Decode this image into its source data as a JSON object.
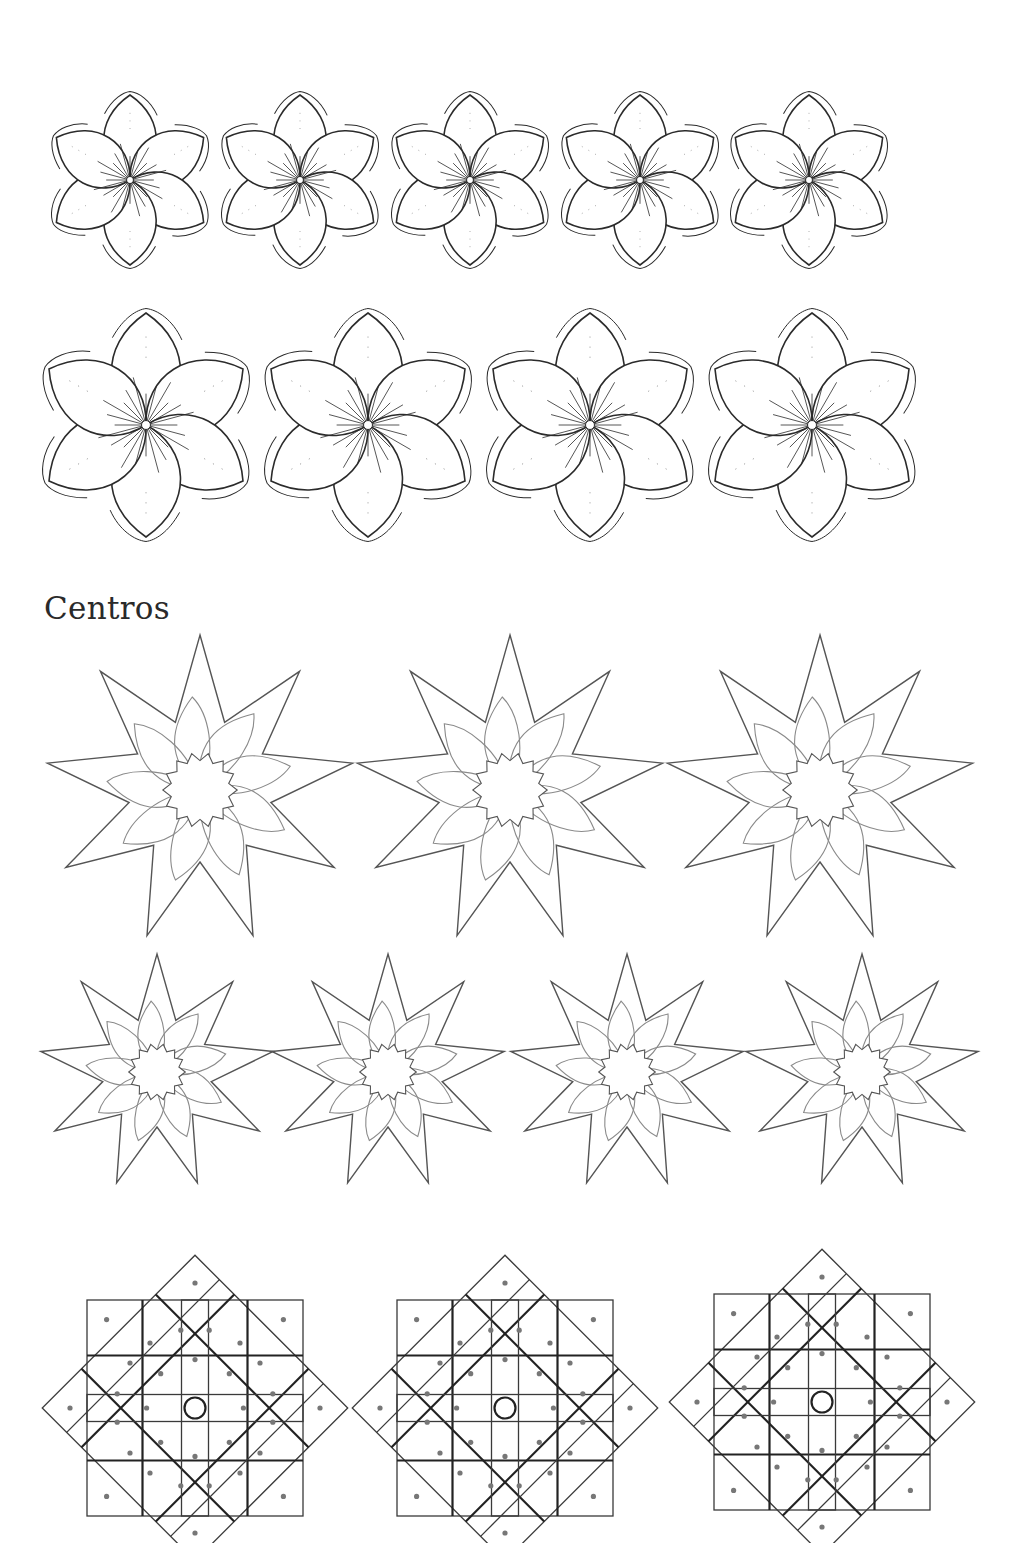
{
  "page": {
    "background": "#ffffff",
    "ink_color": "#2b2b2b",
    "light_ink_color": "#8a8a8a"
  },
  "sections": [
    {
      "id": "flowers-small",
      "type": "six-petal-flower",
      "count": 5,
      "centers": [
        [
          130,
          180
        ],
        [
          300,
          180
        ],
        [
          470,
          180
        ],
        [
          640,
          180
        ],
        [
          809,
          180
        ]
      ],
      "scale": 0.85
    },
    {
      "id": "flowers-large",
      "type": "six-petal-flower",
      "count": 4,
      "centers": [
        [
          146,
          425
        ],
        [
          368,
          425
        ],
        [
          590,
          425
        ],
        [
          812,
          425
        ]
      ],
      "scale": 1.12
    },
    {
      "id": "heading-centros",
      "type": "heading",
      "text": "Centros"
    },
    {
      "id": "stars-large",
      "type": "nine-point-star",
      "count": 3,
      "centers": [
        [
          200,
          790
        ],
        [
          510,
          790
        ],
        [
          820,
          790
        ]
      ],
      "outer_r": 155,
      "inner_r": 72
    },
    {
      "id": "stars-small",
      "type": "nine-point-star",
      "count": 4,
      "centers": [
        [
          157,
          1072
        ],
        [
          388,
          1072
        ],
        [
          627,
          1072
        ],
        [
          862,
          1072
        ]
      ],
      "outer_r": 118,
      "inner_r": 55
    },
    {
      "id": "geometric-medallions",
      "type": "octagram-grid",
      "count": 3,
      "centers": [
        [
          195,
          1408
        ],
        [
          505,
          1408
        ],
        [
          822,
          1402
        ]
      ],
      "size": 150
    }
  ]
}
